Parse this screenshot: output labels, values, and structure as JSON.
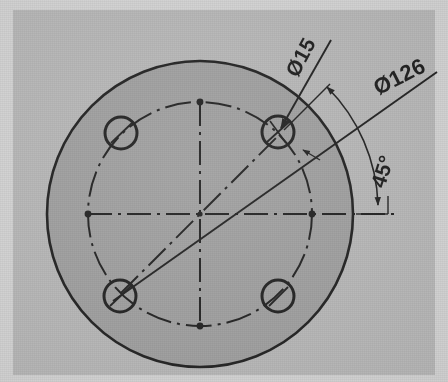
{
  "drawing": {
    "title": "Circular flange with four-hole bolt circle",
    "type": "engineering-drawing",
    "view": "front-view-section",
    "units": "mm"
  },
  "colors": {
    "page_background": "#d2d2d2",
    "frame_fill": "#b9b9b9",
    "plate_fill": "#a0a0a0",
    "line": "#1a1a1a",
    "text": "#161616"
  },
  "geometry": {
    "center": {
      "x": 200,
      "y": 214
    },
    "outer_circle": {
      "radius": 153,
      "label": "plate-outer-edge"
    },
    "bolt_circle": {
      "radius": 112,
      "label": "pitch-circle",
      "linetype": "dash-dot"
    },
    "holes": [
      {
        "id": "hole-top-right",
        "x": 278,
        "y": 132,
        "radius": 16,
        "angle_deg": 45
      },
      {
        "id": "hole-top-left",
        "x": 121,
        "y": 133,
        "radius": 16,
        "angle_deg": 135
      },
      {
        "id": "hole-bottom-left",
        "x": 120,
        "y": 296,
        "radius": 16,
        "angle_deg": 225
      },
      {
        "id": "hole-bottom-right",
        "x": 278,
        "y": 296,
        "radius": 16,
        "angle_deg": 315
      }
    ],
    "centerlines": [
      {
        "id": "centerline-horizontal",
        "orientation": "horizontal"
      },
      {
        "id": "centerline-vertical",
        "orientation": "vertical"
      },
      {
        "id": "centerline-diagonal",
        "orientation": "45-degree"
      }
    ]
  },
  "dimensions": [
    {
      "id": "hole-diameter",
      "label": "Ø15",
      "value": 15,
      "symbol": "Ø",
      "kind": "leader",
      "rotation_deg": -62,
      "text_x": 302,
      "text_y": 58,
      "points_to": "hole-top-right"
    },
    {
      "id": "bolt-circle-diameter",
      "label": "Ø126",
      "value": 126,
      "symbol": "Ø",
      "kind": "diameter",
      "rotation_deg": -27,
      "text_x": 400,
      "text_y": 78
    },
    {
      "id": "hole-spacing-angle",
      "label": "45°",
      "value": 45,
      "symbol": "°",
      "kind": "angular",
      "rotation_deg": -72,
      "text_x": 382,
      "text_y": 172
    }
  ]
}
